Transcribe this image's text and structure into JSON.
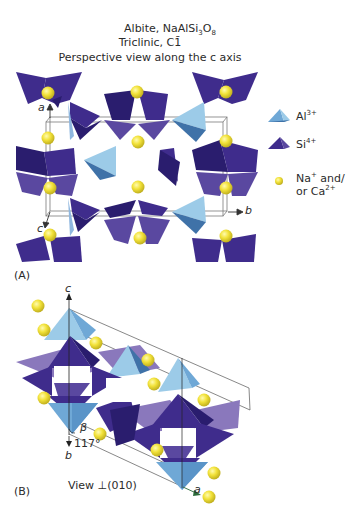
{
  "title": {
    "mineral": "Albite, NaAlSi",
    "formula_sub1": "3",
    "formula_mid": "O",
    "formula_sub2": "8",
    "system": "Triclinic, C",
    "space_group_symbol": "1̄",
    "view_caption": "Perspective view along the c axis"
  },
  "legend": {
    "items": [
      {
        "ion": "Al",
        "charge": "3+",
        "shape": "tetrahedron",
        "color": "#6fa8d6"
      },
      {
        "ion": "Si",
        "charge": "4+",
        "shape": "tetrahedron",
        "color": "#3a2a85"
      },
      {
        "ion_line1": "Na",
        "charge1": "+",
        "line1_suffix": " and/",
        "line2_prefix": "or Ca",
        "charge2": "2+",
        "shape": "sphere",
        "color": "#f2e23a"
      }
    ]
  },
  "panel_a": {
    "label": "(A)",
    "axes": {
      "a": "a",
      "b": "b",
      "c": "c"
    }
  },
  "panel_b": {
    "label": "(B)",
    "axes": {
      "a": "a",
      "b": "b",
      "c": "c"
    },
    "beta_symbol": "β",
    "beta_angle": "117°",
    "view_caption": "View ⊥(010)"
  },
  "colors": {
    "si_dark": "#2a1d6e",
    "si_mid": "#3f2c8c",
    "si_light": "#5a48a0",
    "si_pale": "#8a78bc",
    "al_light": "#9ccbe8",
    "al_mid": "#6fa8d6",
    "al_dark": "#3f72a8",
    "cation": "#f2e23a",
    "cation_shade": "#c9b820"
  }
}
